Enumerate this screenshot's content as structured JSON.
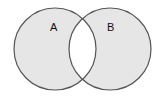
{
  "diagram": {
    "type": "venn",
    "shading": "symmetric-difference",
    "sets": [
      {
        "id": "A",
        "label": "A",
        "cx": 55,
        "cy": 49,
        "r": 41
      },
      {
        "id": "B",
        "label": "B",
        "cx": 110,
        "cy": 49,
        "r": 41
      }
    ],
    "colors": {
      "fill": "#e6e6e6",
      "intersection": "#ffffff",
      "stroke": "#555555",
      "background": "#ffffff"
    }
  }
}
